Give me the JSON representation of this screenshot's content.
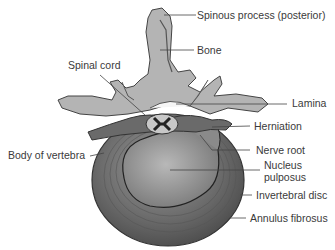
{
  "diagram": {
    "labels": {
      "spinous_process": "Spinous process (posterior)",
      "bone": "Bone",
      "spinal_cord": "Spinal cord",
      "lamina": "Lamina",
      "herniation": "Herniation",
      "body_of_vertebra": "Body of vertebra",
      "nerve_root": "Nerve root",
      "nucleus_pulposus_line1": "Nucleus",
      "nucleus_pulposus_line2": "pulposus",
      "intervertebral_disc": "Invertebral disc",
      "annulus_fibrosus": "Annulus fibrosus"
    }
  }
}
